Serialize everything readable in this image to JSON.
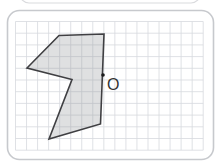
{
  "figure": {
    "type": "geometry-grid-diagram",
    "canvas": {
      "width": 220,
      "height": 164,
      "background": "#ffffff"
    },
    "back_card_edge": {
      "x": 20,
      "y": -27,
      "width": 180,
      "height": 30,
      "radius": 9,
      "border_color": "#dadbde",
      "border_width": 1.2
    },
    "card": {
      "x": 7.5,
      "y": 10.5,
      "width": 206,
      "height": 149,
      "radius": 12,
      "border_color": "#c7c9cd",
      "border_width": 1.6,
      "fill": "#ffffff"
    },
    "grid": {
      "color": "#d7d9de",
      "line_width": 0.8,
      "x_start": 15.5,
      "x_end": 203.2,
      "columns": 17,
      "y_start": 21.5,
      "y_end": 150.2,
      "rows": 11
    },
    "polygon": {
      "fill": "rgba(141,143,148,0.28)",
      "stroke": "#3f3f42",
      "stroke_width": 1.6,
      "points": [
        [
          59,
          35.5
        ],
        [
          104,
          34
        ],
        [
          100.5,
          124
        ],
        [
          49,
          139
        ],
        [
          72,
          79.5
        ],
        [
          27,
          68
        ]
      ]
    },
    "point": {
      "x": 103,
      "y": 75,
      "radius": 1.8,
      "color": "#1b1b1b",
      "label": "O",
      "label_x": 107,
      "label_y": 90,
      "label_size": 16,
      "label_color": "#333333"
    }
  }
}
